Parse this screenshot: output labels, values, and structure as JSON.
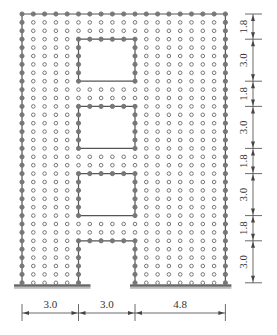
{
  "diagram": {
    "type": "wall-with-openings-node-grid",
    "grid": {
      "columns": 19,
      "rows": 33,
      "x0": 22,
      "y0": 14,
      "dx": 11.3,
      "dy": 8.4
    },
    "colors": {
      "line": "#555555",
      "node": "#777777",
      "ground": "#666666",
      "dim": "#444444"
    },
    "openings": [
      {
        "name": "opening-1",
        "col_start": 5,
        "col_end": 10,
        "row_start": 3,
        "row_end": 8
      },
      {
        "name": "opening-2",
        "col_start": 5,
        "col_end": 10,
        "row_start": 11,
        "row_end": 16
      },
      {
        "name": "opening-3",
        "col_start": 5,
        "col_end": 10,
        "row_start": 19,
        "row_end": 24
      },
      {
        "name": "door-opening",
        "col_start": 5,
        "col_end": 10,
        "row_start": 27,
        "row_end": 32
      }
    ],
    "horizontal_dimensions": [
      "3.0",
      "3.0",
      "4.8"
    ],
    "vertical_dimensions": [
      "1.8",
      "3.0",
      "1.8",
      "3.0",
      "1.8",
      "3.0",
      "1.8",
      "3.0"
    ]
  }
}
